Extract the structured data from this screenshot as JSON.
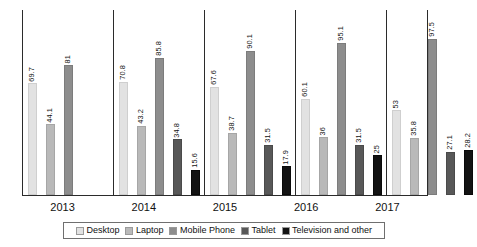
{
  "chart_data": {
    "type": "bar",
    "title": "",
    "subtitle": "",
    "xlabel": "",
    "ylabel": "",
    "ylim": [
      0,
      100
    ],
    "grid": false,
    "legend_position": "bottom",
    "categories": [
      "2013",
      "2014",
      "2015",
      "2016",
      "2017"
    ],
    "series": [
      {
        "name": "Desktop",
        "color": "#e2e2e2",
        "values": [
          69.7,
          70.8,
          67.6,
          60.1,
          53
        ]
      },
      {
        "name": "Laptop",
        "color": "#b9b9b9",
        "values": [
          44.1,
          43.2,
          38.7,
          36,
          35.8
        ]
      },
      {
        "name": "Mobile Phone",
        "color": "#8d8d8d",
        "values": [
          81,
          85.8,
          90.1,
          95.1,
          97.5
        ]
      },
      {
        "name": "Tablet",
        "color": "#585858",
        "values": [
          null,
          34.8,
          31.5,
          31.5,
          27.1
        ]
      },
      {
        "name": "Television and other",
        "color": "#131313",
        "values": [
          null,
          15.6,
          17.9,
          25,
          28.2
        ]
      }
    ]
  }
}
